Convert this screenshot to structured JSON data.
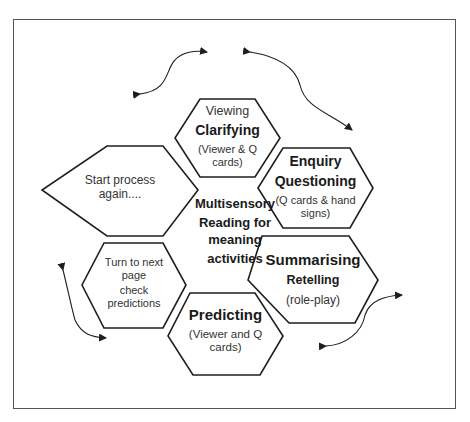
{
  "top_caption_cut": "…",
  "center": {
    "line1": "Multisensory",
    "line2": "Reading for",
    "line3": "meaning",
    "line4": "activities"
  },
  "hexagons": [
    {
      "id": "clarifying",
      "top": "Viewing",
      "title": "Clarifying",
      "sub1": "(Viewer & Q",
      "sub2": "cards)"
    },
    {
      "id": "questioning",
      "top": "Enquiry",
      "title": "Questioning",
      "sub1": "(Q cards & hand",
      "sub2": "signs)"
    },
    {
      "id": "summarising",
      "title": "Summarising",
      "mid": "Retelling",
      "sub1": "(role-play)"
    },
    {
      "id": "predicting",
      "title": "Predicting",
      "sub1": "(Viewer and Q",
      "sub2": "cards)"
    },
    {
      "id": "turn-page",
      "line1": "Turn to next",
      "line2": "page",
      "line3": "check",
      "line4": "predictions"
    },
    {
      "id": "start-again",
      "line1": "Start process",
      "line2": "again...."
    }
  ],
  "colors": {
    "stroke": "#1e1e1e",
    "frame": "#555555",
    "background": "#ffffff"
  }
}
